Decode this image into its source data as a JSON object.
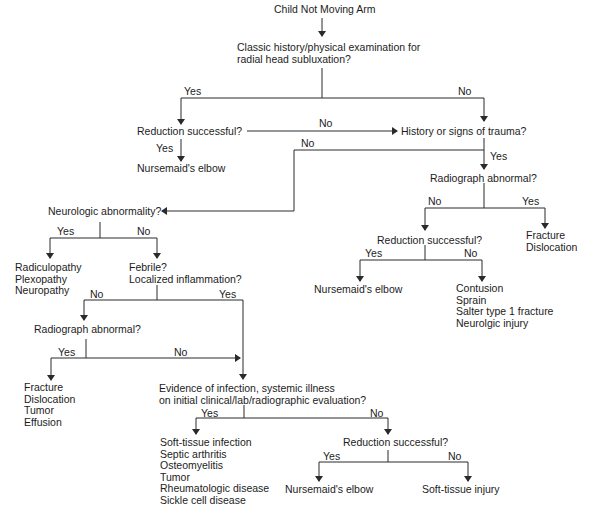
{
  "title": "Child Not Moving Arm",
  "nodes": {
    "start": "Child Not Moving Arm",
    "classic_q": [
      "Classic history/physical examination for",
      "radial head subluxation?"
    ],
    "reduction1": "Reduction successful?",
    "nursemaid1": "Nursemaid's elbow",
    "trauma_q": "History or signs of trauma?",
    "radiograph1": "Radiograph abnormal?",
    "fracture1": [
      "Fracture",
      "Dislocation"
    ],
    "reduction2": "Reduction successful?",
    "nursemaid2": "Nursemaid's elbow",
    "contusion": [
      "Contusion",
      "Sprain",
      "Salter type 1 fracture",
      "Neurolgic injury"
    ],
    "neuro_q": "Neurologic abnormality?",
    "neuro_dx": [
      "Radiculopathy",
      "Plexopathy",
      "Neuropathy"
    ],
    "febrile_q": [
      "Febrile?",
      "Localized inflammation?"
    ],
    "radiograph2": "Radiograph abnormal?",
    "fracture2": [
      "Fracture",
      "Dislocation",
      "Tumor",
      "Effusion"
    ],
    "infection_q": [
      "Evidence of infection, systemic illness",
      "on initial clinical/lab/radiographic evaluation?"
    ],
    "infection_dx": [
      "Soft-tissue infection",
      "Septic arthritis",
      "Osteomyelitis",
      "Tumor",
      "Rheumatologic disease",
      "Sickle cell disease"
    ],
    "reduction3": "Reduction successful?",
    "nursemaid3": "Nursemaid's elbow",
    "softtissue": "Soft-tissue injury"
  },
  "edge_labels": {
    "classic_yes": "Yes",
    "classic_no": "No",
    "red1_no": "No",
    "red1_yes": "Yes",
    "trauma_no": "No",
    "trauma_yes": "Yes",
    "rad1_no": "No",
    "rad1_yes": "Yes",
    "red2_yes": "Yes",
    "red2_no": "No",
    "neuro_yes": "Yes",
    "neuro_no": "No",
    "febrile_no": "No",
    "febrile_yes": "Yes",
    "rad2_yes": "Yes",
    "rad2_no": "No",
    "inf_yes": "Yes",
    "inf_no": "No",
    "red3_yes": "Yes",
    "red3_no": "No"
  },
  "colors": {
    "line": "#2a2a2a",
    "text": "#1c1c1c",
    "background": "#ffffff"
  }
}
